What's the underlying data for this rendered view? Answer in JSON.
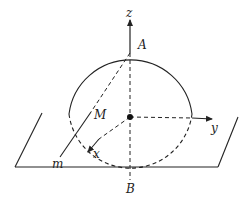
{
  "diagram": {
    "type": "3d-geometry-sphere-plane",
    "colors": {
      "stroke": "#222222",
      "background": "#ffffff"
    },
    "labels": {
      "z_axis": "z",
      "y_axis": "y",
      "x_axis": "x",
      "point_A": "A",
      "point_B": "B",
      "point_M": "M",
      "line_m": "m"
    },
    "elements": [
      {
        "id": "plane",
        "kind": "parallelogram",
        "description": "horizontal plane"
      },
      {
        "id": "sphere",
        "kind": "circle",
        "upper_half": "solid",
        "lower_half": "dashed"
      },
      {
        "id": "center",
        "kind": "point",
        "style": "filled-dot"
      },
      {
        "id": "z-axis",
        "kind": "arrow",
        "label": "z"
      },
      {
        "id": "y-axis",
        "kind": "arrow",
        "label": "y"
      },
      {
        "id": "x-axis",
        "kind": "arrow",
        "label": "x"
      },
      {
        "id": "segment-AB",
        "kind": "dashed-line",
        "from": "A",
        "to": "B"
      },
      {
        "id": "segment-AM",
        "kind": "dashed-line",
        "from": "A",
        "to": "M"
      },
      {
        "id": "line-m",
        "kind": "solid-line",
        "label": "m",
        "through": "M"
      }
    ]
  }
}
